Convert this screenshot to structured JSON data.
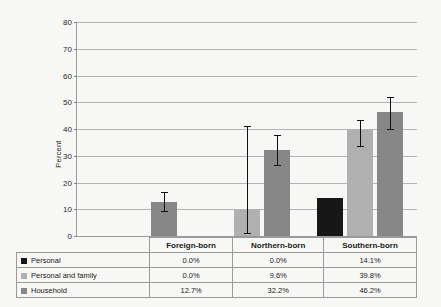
{
  "chart_data": {
    "type": "bar",
    "title": "",
    "xlabel": "",
    "ylabel": "Percent",
    "ylim": [
      0,
      80
    ],
    "yticks": [
      0,
      10,
      20,
      30,
      40,
      50,
      60,
      70,
      80
    ],
    "ytick_labels": [
      "0",
      "10",
      "20",
      "30",
      "40",
      "50",
      "60",
      "70",
      "80"
    ],
    "grid": true,
    "legend_position": "table-below",
    "categories": [
      "Foreign-born",
      "Northern-born",
      "Southern-born"
    ],
    "series": [
      {
        "name": "Personal",
        "color": "#171717",
        "values": [
          0.0,
          0.0,
          14.1
        ],
        "labels": [
          "0.0%",
          "0.0%",
          "14.1%"
        ],
        "error_low": [
          null,
          null,
          null
        ],
        "error_high": [
          null,
          null,
          null
        ]
      },
      {
        "name": "Personal and family",
        "color": "#b0b0b0",
        "values": [
          0.0,
          9.6,
          39.8
        ],
        "labels": [
          "0.0%",
          "9.6%",
          "39.8%"
        ],
        "error_low": [
          null,
          1.0,
          33.8
        ],
        "error_high": [
          null,
          41.2,
          43.5
        ]
      },
      {
        "name": "Household",
        "color": "#878787",
        "values": [
          12.7,
          32.2,
          46.2
        ],
        "labels": [
          "12.7%",
          "32.2%",
          "46.2%"
        ],
        "error_low": [
          9.2,
          26.4,
          40.1
        ],
        "error_high": [
          16.3,
          37.9,
          51.8
        ]
      }
    ]
  },
  "table": {
    "header_blank": "",
    "group_headers": [
      "Foreign-born",
      "Northern-born",
      "Southern-born"
    ],
    "rows": [
      {
        "label": "Personal",
        "swatch": "#171717",
        "values": [
          "0.0%",
          "0.0%",
          "14.1%"
        ]
      },
      {
        "label": "Personal and family",
        "swatch": "#b0b0b0",
        "values": [
          "0.0%",
          "9.6%",
          "39.8%"
        ]
      },
      {
        "label": "Household",
        "swatch": "#878787",
        "values": [
          "12.7%",
          "32.2%",
          "46.2%"
        ]
      }
    ]
  },
  "axis": {
    "y_label": "Percent"
  }
}
